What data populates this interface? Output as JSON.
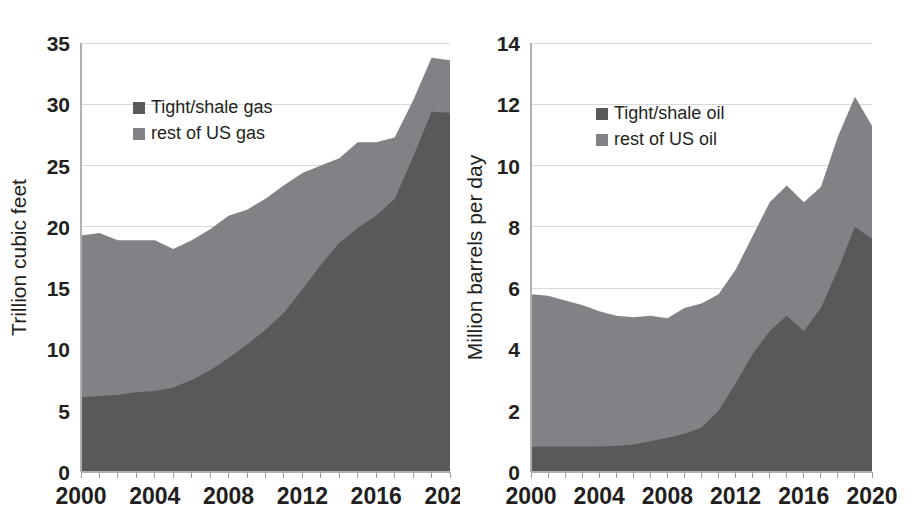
{
  "figure": {
    "title": "",
    "background": "#ffffff",
    "panel_count": 2
  },
  "colors": {
    "series_dark": "#58595b",
    "series_light": "#808285",
    "gridline": "#d9d9d9",
    "axis": "#b0b0b0",
    "text": "#231f20"
  },
  "chart_data": [
    {
      "id": "gas",
      "type": "area",
      "stacked": true,
      "title": "",
      "xlabel": "",
      "ylabel": "Trillion cubic feet",
      "xlim": [
        2000,
        2020
      ],
      "ylim": [
        0,
        35
      ],
      "grid": true,
      "legend_position": "inside-upper-left",
      "yticks": [
        0,
        5,
        10,
        15,
        20,
        25,
        30,
        35
      ],
      "ytick_labels": [
        "0",
        "5",
        "10",
        "15",
        "20",
        "25",
        "30",
        "35"
      ],
      "xticks": [
        2000,
        2004,
        2008,
        2012,
        2016,
        2020
      ],
      "xtick_labels": [
        "2000",
        "2004",
        "2008",
        "2012",
        "2016",
        "2020"
      ],
      "x": [
        2000,
        2001,
        2002,
        2003,
        2004,
        2005,
        2006,
        2007,
        2008,
        2009,
        2010,
        2011,
        2012,
        2013,
        2014,
        2015,
        2016,
        2017,
        2018,
        2019,
        2020
      ],
      "series": [
        {
          "name": "Tight/shale gas",
          "color": "#58595b",
          "values": [
            6.1,
            6.2,
            6.3,
            6.5,
            6.6,
            6.9,
            7.5,
            8.3,
            9.3,
            10.4,
            11.6,
            13.0,
            14.9,
            16.9,
            18.7,
            19.9,
            20.9,
            22.3,
            25.7,
            29.4,
            29.3
          ]
        },
        {
          "name": "rest of US gas",
          "color": "#808285",
          "values": [
            13.2,
            13.3,
            12.6,
            12.4,
            12.3,
            11.3,
            11.4,
            11.5,
            11.6,
            11.0,
            10.7,
            10.4,
            9.5,
            8.1,
            6.9,
            7.0,
            6.0,
            5.0,
            4.6,
            4.4,
            4.3
          ]
        }
      ],
      "totals": [
        19.3,
        19.5,
        18.9,
        18.9,
        18.9,
        18.2,
        18.9,
        19.8,
        20.9,
        21.4,
        22.3,
        23.4,
        24.4,
        25.0,
        25.6,
        26.9,
        26.9,
        27.3,
        30.3,
        33.8,
        33.6
      ]
    },
    {
      "id": "oil",
      "type": "area",
      "stacked": true,
      "title": "",
      "xlabel": "",
      "ylabel": "Million barrels per day",
      "xlim": [
        2000,
        2020
      ],
      "ylim": [
        0,
        14
      ],
      "grid": true,
      "legend_position": "inside-upper-left",
      "yticks": [
        0,
        2,
        4,
        6,
        8,
        10,
        12,
        14
      ],
      "ytick_labels": [
        "0",
        "2",
        "4",
        "6",
        "8",
        "10",
        "12",
        "14"
      ],
      "xticks": [
        2000,
        2004,
        2008,
        2012,
        2016,
        2020
      ],
      "xtick_labels": [
        "2000",
        "2004",
        "2008",
        "2012",
        "2016",
        "2020"
      ],
      "x": [
        2000,
        2001,
        2002,
        2003,
        2004,
        2005,
        2006,
        2007,
        2008,
        2009,
        2010,
        2011,
        2012,
        2013,
        2014,
        2015,
        2016,
        2017,
        2018,
        2019,
        2020
      ],
      "series": [
        {
          "name": "Tight/shale oil",
          "color": "#58595b",
          "values": [
            0.82,
            0.82,
            0.82,
            0.82,
            0.83,
            0.85,
            0.9,
            1.0,
            1.12,
            1.25,
            1.45,
            2.0,
            2.9,
            3.85,
            4.6,
            5.1,
            4.6,
            5.35,
            6.6,
            8.0,
            7.6
          ]
        },
        {
          "name": "rest of US oil",
          "color": "#808285",
          "values": [
            4.98,
            4.93,
            4.78,
            4.63,
            4.42,
            4.25,
            4.15,
            4.1,
            3.9,
            4.1,
            4.05,
            3.8,
            3.7,
            3.85,
            4.2,
            4.25,
            4.2,
            3.95,
            4.35,
            4.25,
            3.7
          ]
        }
      ],
      "totals": [
        5.8,
        5.75,
        5.6,
        5.45,
        5.25,
        5.1,
        5.05,
        5.1,
        5.02,
        5.35,
        5.5,
        5.8,
        6.6,
        7.7,
        8.8,
        9.35,
        8.8,
        9.3,
        10.95,
        12.25,
        11.3
      ]
    }
  ],
  "panels": [
    {
      "name": "gas-panel",
      "ylabel": "Trillion cubic feet",
      "legend": [
        {
          "label": "Tight/shale gas",
          "color": "#58595b"
        },
        {
          "label": "rest of US gas",
          "color": "#808285"
        }
      ]
    },
    {
      "name": "oil-panel",
      "ylabel": "Million barrels per day",
      "legend": [
        {
          "label": "Tight/shale oil",
          "color": "#58595b"
        },
        {
          "label": "rest of US oil",
          "color": "#808285"
        }
      ]
    }
  ]
}
